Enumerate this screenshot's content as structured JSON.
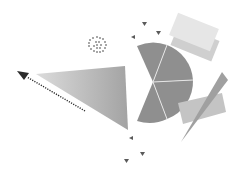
{
  "illustration": {
    "background": "#ffffff",
    "colors": {
      "pie": "#8f8f8f",
      "pie_divider": "#e6e6e6",
      "triangle_light": "#d9d9d9",
      "triangle_dark": "#a6a6a6",
      "arrow": "#2b2b2b",
      "spiral": "#3a3a3a",
      "card_front": "#e6e6e6",
      "card_back": "#cfcfcf",
      "rect_tilted": "#c4c4c4",
      "needle": "#a0a0a0",
      "marker": "#5a5a5a"
    },
    "pie_segments": 4,
    "markers": 8
  }
}
